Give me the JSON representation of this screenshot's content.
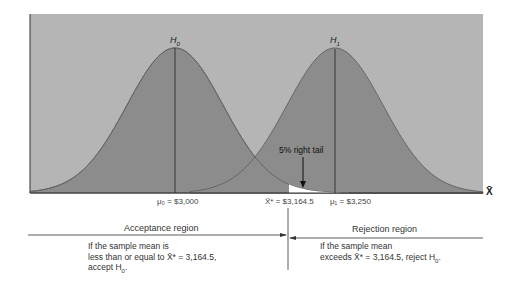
{
  "figure": {
    "type": "hypothesis-test-distributions",
    "colors": {
      "background_panel": "#b5b5b5",
      "curve_fill": "#8c8c8c",
      "curve_stroke": "#666666",
      "rejection_tail": "#ffffff",
      "lines": "#222222"
    }
  },
  "curves": {
    "h0": {
      "label": "H",
      "sub": "0",
      "mean_label": "μ₀ = $3,000"
    },
    "h1": {
      "label": "H",
      "sub": "1",
      "mean_label": "μ₁ = $3,250"
    }
  },
  "critical_value_label": "X̄* = $3,164.5",
  "tail_annotation": "5% right tail",
  "x_axis_label": "X̄",
  "regions": {
    "acceptance": {
      "title": "Acceptance region",
      "line1": "If the sample mean is",
      "line2": "less than or equal to X̄* = 3,164.5,",
      "line3_prefix": "accept H",
      "line3_sub": "0",
      "line3_suffix": "."
    },
    "rejection": {
      "title": "Rejection region",
      "line1": "If the sample mean",
      "line2_prefix": "exceeds X̄* = 3,164.5, reject H",
      "line2_sub": "0",
      "line2_suffix": "."
    }
  }
}
